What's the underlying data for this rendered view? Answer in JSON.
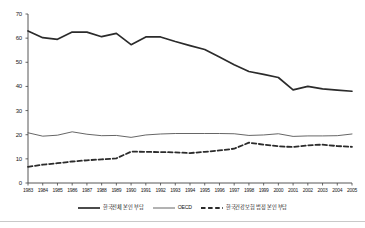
{
  "chart_data": {
    "type": "line",
    "title": "",
    "subtitle": "",
    "xlabel": "",
    "ylabel": "",
    "xlim": [
      1983,
      2005
    ],
    "ylim": [
      0,
      70
    ],
    "ytick_step": 10,
    "grid": false,
    "legend_position": "bottom",
    "categories": [
      "1983",
      "1984",
      "1985",
      "1986",
      "1987",
      "1988",
      "1989",
      "1990",
      "1991",
      "1992",
      "1993",
      "1994",
      "1995",
      "1996",
      "1997",
      "1998",
      "1999",
      "2000",
      "2001",
      "2002",
      "2003",
      "2004",
      "2005"
    ],
    "yticks": [
      "0",
      "10",
      "20",
      "30",
      "40",
      "50",
      "60",
      "70"
    ],
    "series": [
      {
        "name": "한국전체 본인 부담",
        "style": "solid-thick",
        "color": "#2b2b2b",
        "values": [
          63.0,
          60.2,
          59.5,
          62.5,
          62.5,
          60.6,
          62.0,
          57.3,
          60.5,
          60.5,
          58.6,
          56.9,
          55.3,
          52.2,
          49.0,
          46.2,
          45.0,
          43.7,
          38.6,
          40.0,
          39.0,
          38.5,
          38.0
        ]
      },
      {
        "name": "OECD",
        "style": "solid-thin",
        "color": "#555555",
        "values": [
          20.8,
          19.4,
          19.8,
          21.2,
          20.2,
          19.6,
          19.7,
          18.9,
          19.9,
          20.3,
          20.5,
          20.5,
          20.5,
          20.5,
          20.4,
          19.7,
          19.9,
          20.4,
          19.3,
          19.5,
          19.5,
          19.6,
          20.3
        ]
      },
      {
        "name": "한국건강보험 법정 본인 부담",
        "style": "dashed-thick",
        "color": "#2b2b2b",
        "values": [
          6.7,
          7.6,
          8.2,
          8.9,
          9.4,
          9.8,
          10.2,
          13.0,
          12.9,
          12.8,
          12.7,
          12.4,
          12.9,
          13.5,
          14.2,
          16.7,
          15.9,
          15.2,
          14.9,
          15.6,
          15.9,
          15.3,
          15.0
        ]
      }
    ]
  },
  "axis": {
    "y_min_label": "0",
    "y_max_label": "70"
  }
}
